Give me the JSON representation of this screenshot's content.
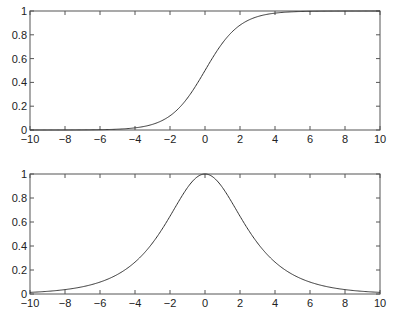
{
  "chart_data": [
    {
      "type": "line",
      "title": "",
      "xlabel": "",
      "ylabel": "",
      "xlim": [
        -10,
        10
      ],
      "ylim": [
        0,
        1
      ],
      "grid": false,
      "x_ticks": [
        -10,
        -8,
        -6,
        -4,
        -2,
        0,
        2,
        4,
        6,
        8,
        10
      ],
      "y_ticks": [
        0,
        0.2,
        0.4,
        0.6,
        0.8,
        1
      ],
      "x_tick_labels": [
        "−10",
        "−8",
        "−6",
        "−4",
        "−2",
        "0",
        "2",
        "4",
        "6",
        "8",
        "10"
      ],
      "y_tick_labels": [
        "0",
        "0.2",
        "0.4",
        "0.6",
        "0.8",
        "1"
      ],
      "series": [
        {
          "name": "sigmoid",
          "x": [
            -10,
            -8,
            -6,
            -4,
            -3,
            -2,
            -1,
            0,
            1,
            2,
            3,
            4,
            6,
            8,
            10
          ],
          "values": [
            0.0,
            0.0003,
            0.0025,
            0.018,
            0.047,
            0.12,
            0.27,
            0.5,
            0.73,
            0.88,
            0.953,
            0.982,
            0.9975,
            0.9997,
            1.0
          ]
        }
      ],
      "box": {
        "left": 30,
        "top": 11,
        "right": 380,
        "bottom": 130
      }
    },
    {
      "type": "line",
      "title": "",
      "xlabel": "",
      "ylabel": "",
      "xlim": [
        -10,
        10
      ],
      "ylim": [
        0,
        1
      ],
      "grid": false,
      "x_ticks": [
        -10,
        -8,
        -6,
        -4,
        -2,
        0,
        2,
        4,
        6,
        8,
        10
      ],
      "y_ticks": [
        0,
        0.2,
        0.4,
        0.6,
        0.8,
        1
      ],
      "x_tick_labels": [
        "−10",
        "−8",
        "−6",
        "−4",
        "−2",
        "0",
        "2",
        "4",
        "6",
        "8",
        "10"
      ],
      "y_tick_labels": [
        "0",
        "0.2",
        "0.4",
        "0.6",
        "0.8",
        "1"
      ],
      "series": [
        {
          "name": "bell",
          "x": [
            -10,
            -8,
            -6,
            -4,
            -3,
            -2,
            -1,
            0,
            1,
            2,
            3,
            4,
            6,
            8,
            10
          ],
          "values": [
            0.013,
            0.037,
            0.099,
            0.266,
            0.425,
            0.648,
            0.887,
            1.0,
            0.887,
            0.648,
            0.425,
            0.266,
            0.099,
            0.037,
            0.013
          ]
        }
      ],
      "box": {
        "left": 30,
        "top": 174,
        "right": 380,
        "bottom": 294
      }
    }
  ]
}
